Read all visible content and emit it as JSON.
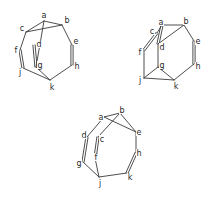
{
  "figure": {
    "structures": [
      {
        "id": "structure-1",
        "atoms": [
          {
            "label": "a",
            "x": 44,
            "y": 21,
            "lx": 44,
            "ly": 15
          },
          {
            "label": "b",
            "x": 62,
            "y": 25,
            "lx": 67,
            "ly": 20
          },
          {
            "label": "c",
            "x": 26,
            "y": 32,
            "lx": 22,
            "ly": 28
          },
          {
            "label": "d",
            "x": 34,
            "y": 45,
            "lx": 39,
            "ly": 44
          },
          {
            "label": "e",
            "x": 72,
            "y": 45,
            "lx": 76,
            "ly": 41
          },
          {
            "label": "f",
            "x": 20,
            "y": 50,
            "lx": 16,
            "ly": 50
          },
          {
            "label": "g",
            "x": 36,
            "y": 67,
            "lx": 40,
            "ly": 65
          },
          {
            "label": "h",
            "x": 72,
            "y": 65,
            "lx": 77,
            "ly": 66
          },
          {
            "label": "j",
            "x": 23,
            "y": 68,
            "lx": 20,
            "ly": 72
          },
          {
            "label": "k",
            "x": 50,
            "y": 80,
            "lx": 52,
            "ly": 87
          }
        ],
        "bonds": [
          [
            "a",
            "b",
            1
          ],
          [
            "a",
            "c",
            1
          ],
          [
            "c",
            "b",
            1
          ],
          [
            "a",
            "g",
            1
          ],
          [
            "b",
            "e",
            1
          ],
          [
            "e",
            "h",
            2
          ],
          [
            "h",
            "k",
            1
          ],
          [
            "c",
            "f",
            1
          ],
          [
            "f",
            "j",
            2
          ],
          [
            "j",
            "k",
            1
          ],
          [
            "d",
            "g",
            2
          ],
          [
            "g",
            "k",
            1
          ]
        ]
      },
      {
        "id": "structure-2",
        "atoms": [
          {
            "label": "a",
            "x": 162,
            "y": 25,
            "lx": 161,
            "ly": 22
          },
          {
            "label": "b",
            "x": 184,
            "y": 25,
            "lx": 186,
            "ly": 21
          },
          {
            "label": "c",
            "x": 157,
            "y": 33,
            "lx": 152,
            "ly": 31
          },
          {
            "label": "d",
            "x": 158,
            "y": 44,
            "lx": 162,
            "ly": 47
          },
          {
            "label": "e",
            "x": 194,
            "y": 41,
            "lx": 198,
            "ly": 41
          },
          {
            "label": "f",
            "x": 144,
            "y": 50,
            "lx": 140,
            "ly": 52
          },
          {
            "label": "g",
            "x": 158,
            "y": 67,
            "lx": 162,
            "ly": 65
          },
          {
            "label": "h",
            "x": 194,
            "y": 64,
            "lx": 198,
            "ly": 66
          },
          {
            "label": "j",
            "x": 144,
            "y": 78,
            "lx": 140,
            "ly": 80
          },
          {
            "label": "k",
            "x": 174,
            "y": 80,
            "lx": 176,
            "ly": 86
          }
        ],
        "bonds": [
          [
            "a",
            "b",
            1
          ],
          [
            "a",
            "d",
            2
          ],
          [
            "d",
            "b",
            1
          ],
          [
            "a",
            "c",
            1
          ],
          [
            "c",
            "f",
            2
          ],
          [
            "b",
            "e",
            1
          ],
          [
            "e",
            "h",
            2
          ],
          [
            "h",
            "k",
            1
          ],
          [
            "f",
            "j",
            1
          ],
          [
            "j",
            "k",
            1
          ],
          [
            "d",
            "g",
            1
          ],
          [
            "g",
            "k",
            1
          ],
          [
            "g",
            "j",
            1
          ]
        ]
      },
      {
        "id": "structure-3",
        "atoms": [
          {
            "label": "a",
            "x": 104,
            "y": 117,
            "lx": 101,
            "ly": 117
          },
          {
            "label": "b",
            "x": 120,
            "y": 113,
            "lx": 122,
            "ly": 110
          },
          {
            "label": "c",
            "x": 98,
            "y": 137,
            "lx": 102,
            "ly": 139
          },
          {
            "label": "d",
            "x": 87,
            "y": 137,
            "lx": 84,
            "ly": 135
          },
          {
            "label": "e",
            "x": 136,
            "y": 132,
            "lx": 139,
            "ly": 132
          },
          {
            "label": "f",
            "x": 95,
            "y": 158,
            "lx": 96,
            "ly": 157
          },
          {
            "label": "g",
            "x": 83,
            "y": 162,
            "lx": 79,
            "ly": 163
          },
          {
            "label": "h",
            "x": 136,
            "y": 153,
            "lx": 139,
            "ly": 153
          },
          {
            "label": "j",
            "x": 99,
            "y": 177,
            "lx": 100,
            "ly": 183
          },
          {
            "label": "k",
            "x": 127,
            "y": 173,
            "lx": 130,
            "ly": 177
          }
        ],
        "bonds": [
          [
            "d",
            "a",
            1
          ],
          [
            "a",
            "b",
            1
          ],
          [
            "a",
            "e",
            1
          ],
          [
            "b",
            "e",
            1
          ],
          [
            "c",
            "b",
            1
          ],
          [
            "d",
            "g",
            2
          ],
          [
            "c",
            "f",
            2
          ],
          [
            "e",
            "h",
            1
          ],
          [
            "h",
            "k",
            2
          ],
          [
            "k",
            "j",
            1
          ],
          [
            "g",
            "j",
            1
          ],
          [
            "f",
            "j",
            1
          ]
        ]
      }
    ]
  }
}
